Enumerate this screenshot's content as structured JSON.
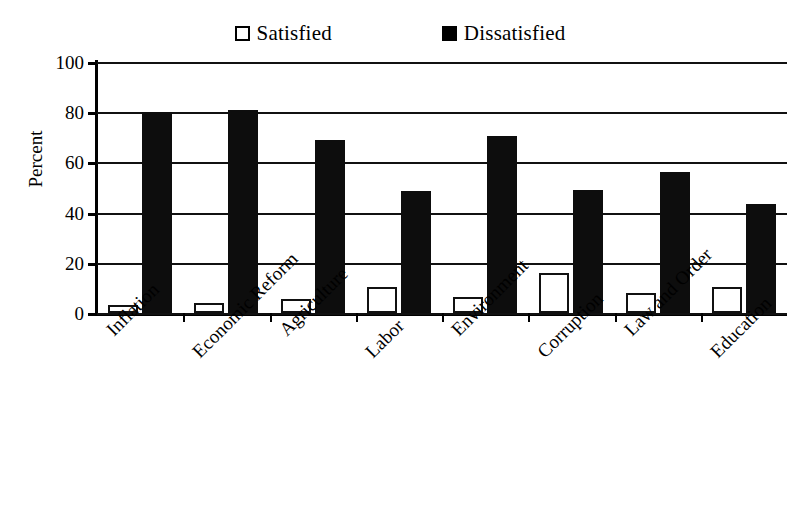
{
  "legend": {
    "position": "top-center",
    "entries": [
      {
        "label": "Satisfied",
        "swatch": "open-square-icon",
        "color": "#ffffff"
      },
      {
        "label": "Dissatisfied",
        "swatch": "filled-square-icon",
        "color": "#000000"
      }
    ]
  },
  "axes": {
    "ylabel": "Percent",
    "xlabel": "",
    "yticks": [
      "100",
      "80",
      "60",
      "40",
      "20",
      "0"
    ]
  },
  "chart_data": {
    "type": "bar",
    "title": "",
    "subtitle": "",
    "xlabel": "",
    "ylabel": "Percent",
    "ylim": [
      0,
      100
    ],
    "ytick_values": [
      0,
      20,
      40,
      60,
      80,
      100
    ],
    "grid": true,
    "grid_axis": "y",
    "legend_position": "top-center",
    "categories": [
      "Inflation",
      "Economic Reform",
      "Agriculture",
      "Labor",
      "Environment",
      "Corruption",
      "Law and Order",
      "Education"
    ],
    "series": [
      {
        "name": "Satisfied",
        "color": "#ffffff",
        "edgecolor": "#000000",
        "values": [
          3,
          4,
          5.5,
          10.5,
          6.5,
          16,
          8,
          10.5
        ]
      },
      {
        "name": "Dissatisfied",
        "color": "#000000",
        "edgecolor": "#000000",
        "values": [
          80,
          81,
          69,
          48.5,
          70.5,
          49,
          56,
          43.5
        ]
      }
    ]
  }
}
